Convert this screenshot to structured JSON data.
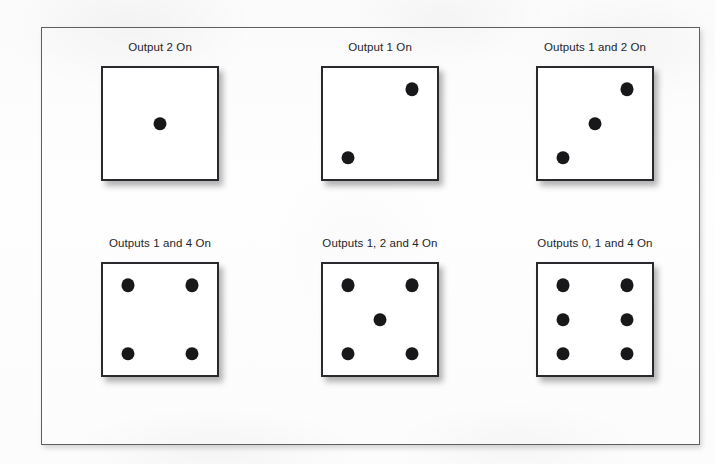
{
  "figure": {
    "border_color": "#5f5f63",
    "pip_color": "#18181a",
    "die_face_color": "#ffffff",
    "background_color": "#fdfdfd"
  },
  "cells": [
    {
      "caption": "Output 2 On",
      "die_value": 1,
      "pips": [
        "center"
      ]
    },
    {
      "caption": "Output 1 On",
      "die_value": 2,
      "pips": [
        "top-right",
        "bottom-left"
      ]
    },
    {
      "caption": "Outputs 1 and 2 On",
      "die_value": 3,
      "pips": [
        "top-right",
        "center",
        "bottom-left"
      ]
    },
    {
      "caption": "Outputs 1 and 4 On",
      "die_value": 4,
      "pips": [
        "top-left",
        "top-right",
        "bottom-left",
        "bottom-right"
      ]
    },
    {
      "caption": "Outputs 1, 2 and 4 On",
      "die_value": 5,
      "pips": [
        "top-left",
        "top-right",
        "center",
        "bottom-left",
        "bottom-right"
      ]
    },
    {
      "caption": "Outputs 0, 1 and 4 On",
      "die_value": 6,
      "pips": [
        "top-left",
        "top-right",
        "middle-left",
        "middle-right",
        "bottom-left",
        "bottom-right"
      ]
    }
  ]
}
